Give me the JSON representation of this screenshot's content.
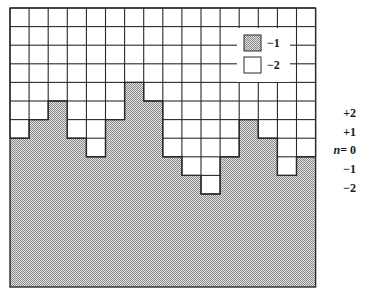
{
  "diagram": {
    "type": "lattice-cross-section",
    "grid": {
      "columns": 16,
      "rows": 15,
      "x0": 10,
      "y0": 8,
      "cell_w": 19.1,
      "cell_h": 18.6
    },
    "shaded_top_row_by_column": [
      7,
      6,
      5,
      7,
      8,
      6,
      4,
      5,
      8,
      9,
      10,
      8,
      6,
      7,
      9,
      8
    ],
    "colors": {
      "line": "#2a2a2a",
      "shade_dark": "#8a8a8a",
      "shade_light": "#e2e2e2",
      "background": "#ffffff"
    }
  },
  "legend": {
    "items": [
      {
        "swatch": "shaded",
        "label": "−1"
      },
      {
        "swatch": "white",
        "label": "−2"
      }
    ]
  },
  "level_labels": [
    {
      "text": "+2",
      "y": 113
    },
    {
      "text": "+1",
      "y": 132
    },
    {
      "prefix": "n",
      "text": "= 0",
      "y": 150
    },
    {
      "text": "−1",
      "y": 169
    },
    {
      "text": "−2",
      "y": 188
    }
  ]
}
